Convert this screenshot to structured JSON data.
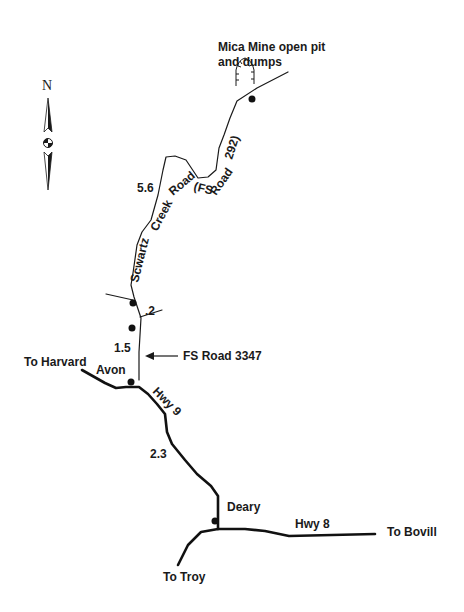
{
  "map": {
    "title": "Mica Mine open pit and dumps",
    "north_label": "N",
    "colors": {
      "ink": "#1a1a1a",
      "background": "#ffffff"
    },
    "labels": {
      "mine_line1": "Mica Mine open pit",
      "mine_line2": "and dumps",
      "road_segment_a": "Scwartz",
      "road_segment_b": "Creek",
      "road_segment_c": "Road",
      "road_segment_d": "(FS",
      "road_segment_e": "Road",
      "road_segment_f": "292)",
      "dist_5_6": "5.6",
      "dist_0_2": ".2",
      "dist_1_5": "1.5",
      "fs_road_3347": "FS Road 3347",
      "to_harvard": "To Harvard",
      "avon": "Avon",
      "hwy9": "Hwy 9",
      "dist_2_3": "2.3",
      "deary": "Deary",
      "hwy8": "Hwy 8",
      "to_bovill": "To Bovill",
      "to_troy": "To Troy"
    },
    "places": [
      {
        "name": "Mica Mine",
        "icon": "mine-pit-icon"
      },
      {
        "name": "Avon",
        "icon": "town-dot-icon"
      },
      {
        "name": "Deary",
        "icon": "town-dot-icon"
      }
    ],
    "roads": [
      {
        "name": "Scwartz Creek Road (FS Road 292)",
        "distance": "5.6"
      },
      {
        "name": "FS Road 3347"
      },
      {
        "name": "Hwy 9",
        "distance": "2.3"
      },
      {
        "name": "Hwy 8"
      }
    ]
  }
}
